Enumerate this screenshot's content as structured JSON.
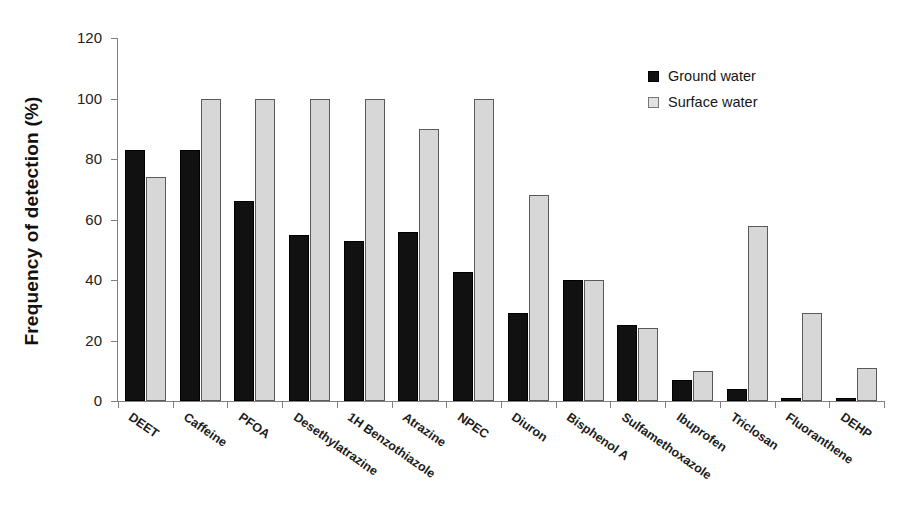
{
  "chart_data": {
    "type": "bar",
    "title": "",
    "xlabel": "",
    "ylabel": "Frequency of detection (%)",
    "ylim": [
      0,
      120
    ],
    "yticks": [
      0,
      20,
      40,
      60,
      80,
      100,
      120
    ],
    "grid": false,
    "legend_position": "top-right",
    "categories": [
      "DEET",
      "Caffeine",
      "PFOA",
      "Desethylatrazine",
      "1H Benzothiazole",
      "Atrazine",
      "NPEC",
      "Diuron",
      "Bisphenol A",
      "Sulfamethoxazole",
      "Ibuprofen",
      "Triclosan",
      "Fluoranthene",
      "DEHP"
    ],
    "series": [
      {
        "name": "Ground water",
        "color": "#111111",
        "values": [
          83,
          83,
          66,
          55,
          53,
          56,
          42.5,
          29,
          40,
          25,
          7,
          4,
          1,
          1
        ]
      },
      {
        "name": "Surface water",
        "color": "#d7d7d7",
        "values": [
          74,
          100,
          100,
          100,
          100,
          90,
          100,
          68,
          40,
          24,
          10,
          58,
          29,
          11
        ]
      }
    ]
  },
  "legend": {
    "entries": [
      {
        "label": "Ground water"
      },
      {
        "label": "Surface water"
      }
    ]
  },
  "axis": {
    "y_title": "Frequency of detection (%)",
    "y_tick_labels": [
      "0",
      "20",
      "40",
      "60",
      "80",
      "100",
      "120"
    ]
  }
}
